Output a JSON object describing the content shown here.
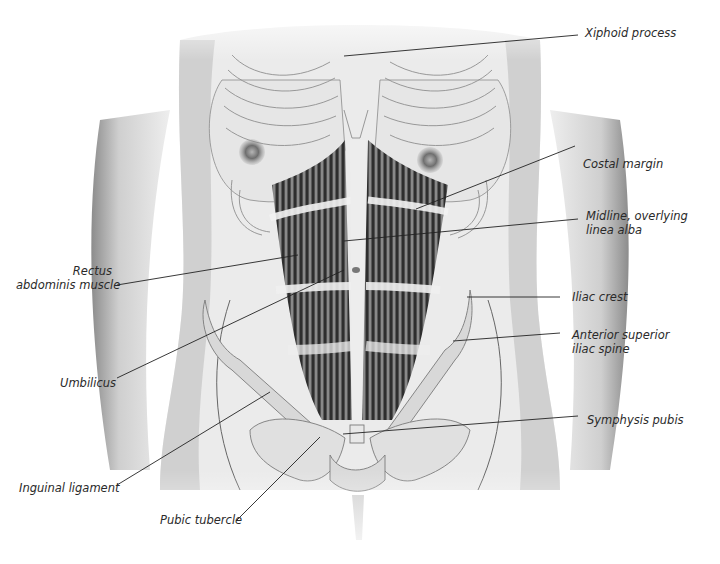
{
  "figure": {
    "colors": {
      "skin": "#e9e9e9",
      "skin_shadow": "#9a9a9a",
      "outline": "#555555",
      "muscle_dark": "#3a3a3a",
      "muscle_light": "#f2f2f2",
      "bone": "#d9d9d9",
      "leader": "#222222",
      "text": "#2a2a2a"
    }
  },
  "labels": [
    {
      "id": "xiphoid-process",
      "lines": [
        "Xiphoid process"
      ],
      "x": 585,
      "y": 26,
      "align": "left",
      "leader": [
        [
          578,
          35
        ],
        [
          344,
          56
        ]
      ]
    },
    {
      "id": "costal-margin",
      "lines": [
        "Costal margin"
      ],
      "x": 583,
      "y": 157,
      "align": "left",
      "leader": [
        [
          575,
          146
        ],
        [
          416,
          209
        ]
      ]
    },
    {
      "id": "midline-linea-alba",
      "lines": [
        "Midline, overlying",
        "linea alba"
      ],
      "x": 586,
      "y": 209,
      "align": "left",
      "leader": [
        [
          578,
          219
        ],
        [
          344,
          241
        ]
      ]
    },
    {
      "id": "rectus-abdominis",
      "lines": [
        "Rectus",
        "abdominis muscle"
      ],
      "x": 16,
      "y": 264,
      "align": "right",
      "w": 96,
      "leader": [
        [
          117,
          285
        ],
        [
          298,
          255
        ]
      ]
    },
    {
      "id": "iliac-crest",
      "lines": [
        "Iliac crest"
      ],
      "x": 572,
      "y": 290,
      "align": "left",
      "leader": [
        [
          560,
          297
        ],
        [
          467,
          297
        ]
      ]
    },
    {
      "id": "anterior-superior-iliac-spine",
      "lines": [
        "Anterior superior",
        "iliac spine"
      ],
      "x": 572,
      "y": 328,
      "align": "left",
      "leader": [
        [
          560,
          333
        ],
        [
          453,
          341
        ]
      ]
    },
    {
      "id": "umbilicus",
      "lines": [
        "Umbilicus"
      ],
      "x": 60,
      "y": 376,
      "align": "right",
      "w": 52,
      "leader": [
        [
          117,
          378
        ],
        [
          344,
          270
        ]
      ]
    },
    {
      "id": "symphysis-pubis",
      "lines": [
        "Symphysis pubis"
      ],
      "x": 587,
      "y": 413,
      "align": "left",
      "leader": [
        [
          578,
          416
        ],
        [
          343,
          434
        ]
      ]
    },
    {
      "id": "inguinal-ligament",
      "lines": [
        "Inguinal ligament"
      ],
      "x": 19,
      "y": 481,
      "align": "left",
      "leader": [
        [
          117,
          485
        ],
        [
          270,
          392
        ]
      ]
    },
    {
      "id": "pubic-tubercle",
      "lines": [
        "Pubic tubercle"
      ],
      "x": 160,
      "y": 513,
      "align": "left",
      "leader": [
        [
          236,
          521
        ],
        [
          320,
          437
        ]
      ]
    }
  ]
}
